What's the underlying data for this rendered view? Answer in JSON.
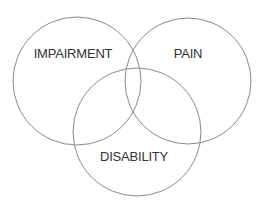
{
  "diagram": {
    "type": "venn",
    "stroke_color": "#8a8a8a",
    "text_color": "#333333",
    "background": "#ffffff",
    "sets": [
      {
        "id": "impairment",
        "label": "IMPAIRMENT",
        "cx": 77,
        "cy": 81,
        "r": 64,
        "label_x": 73,
        "label_y": 58
      },
      {
        "id": "pain",
        "label": "PAIN",
        "cx": 188,
        "cy": 81,
        "r": 63,
        "label_x": 188,
        "label_y": 58
      },
      {
        "id": "disability",
        "label": "DISABILITY",
        "cx": 137,
        "cy": 132,
        "r": 64,
        "label_x": 134,
        "label_y": 161
      }
    ]
  }
}
